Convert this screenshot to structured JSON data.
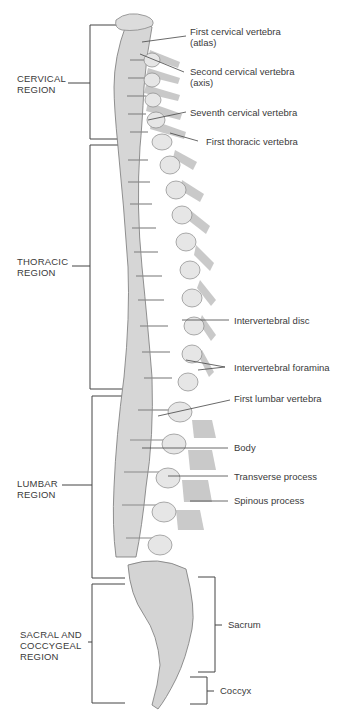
{
  "diagram": {
    "regions": [
      {
        "id": "cervical",
        "line1": "CERVICAL",
        "line2": "REGION",
        "line3": ""
      },
      {
        "id": "thoracic",
        "line1": "THORACIC",
        "line2": "REGION",
        "line3": ""
      },
      {
        "id": "lumbar",
        "line1": "LUMBAR",
        "line2": "REGION",
        "line3": ""
      },
      {
        "id": "sacral",
        "line1": "SACRAL AND",
        "line2": "COCCYGEAL",
        "line3": "REGION"
      }
    ],
    "labels": [
      {
        "line1": "First cervical vertebra",
        "line2": "(atlas)"
      },
      {
        "line1": "Second cervical vertebra",
        "line2": "(axis)"
      },
      {
        "line1": "Seventh cervical vertebra",
        "line2": ""
      },
      {
        "line1": "First thoracic vertebra",
        "line2": ""
      },
      {
        "line1": "Intervertebral disc",
        "line2": ""
      },
      {
        "line1": "Intervertebral foramina",
        "line2": ""
      },
      {
        "line1": "First lumbar vertebra",
        "line2": ""
      },
      {
        "line1": "Body",
        "line2": ""
      },
      {
        "line1": "Transverse process",
        "line2": ""
      },
      {
        "line1": "Spinous process",
        "line2": ""
      },
      {
        "line1": "Sacrum",
        "line2": ""
      },
      {
        "line1": "Coccyx",
        "line2": ""
      }
    ],
    "colors": {
      "bone": "#d9d9d9",
      "bone_shade": "#a8a8a8",
      "disc": "#bdbdbd",
      "line": "#444444",
      "spinous": "#b5b5b5"
    }
  }
}
